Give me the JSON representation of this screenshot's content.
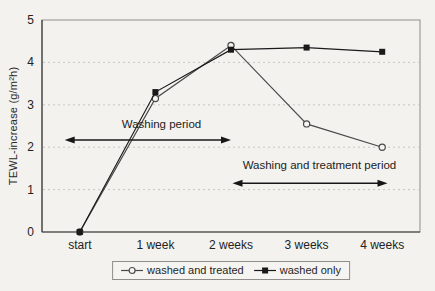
{
  "figure": {
    "background": "#f3f2ef",
    "ink_color": "#1a1a1a",
    "grid_color": "#c9c6c0"
  },
  "chart_data": {
    "type": "line",
    "title": "",
    "xlabel": "",
    "ylabel": "TEWL-increase (g/m²h)",
    "ylim": [
      0,
      5
    ],
    "yticks": [
      0,
      1,
      2,
      3,
      4,
      5
    ],
    "grid": "horizontal dotted lines at 1,2,3,4",
    "legend_position": "bottom-center",
    "categories": [
      "start",
      "1 week",
      "2 weeks",
      "3 weeks",
      "4 weeks"
    ],
    "series": [
      {
        "name": "washed and treated",
        "marker": "circle",
        "color": "#4a4a4a",
        "values": [
          0,
          3.15,
          4.4,
          2.55,
          2.0
        ]
      },
      {
        "name": "washed only",
        "marker": "square",
        "color": "#1a1a1a",
        "values": [
          0,
          3.3,
          4.3,
          4.35,
          4.25
        ]
      }
    ],
    "annotations": [
      {
        "text": "Washing period",
        "x_from": -0.2,
        "x_to": 2.0,
        "arrow_y": 2.17,
        "text_x": 1.08,
        "text_y": 2.45
      },
      {
        "text": "Washing and treatment period",
        "x_from": 2.02,
        "x_to": 4.07,
        "arrow_y": 1.15,
        "text_x": 3.17,
        "text_y": 1.48
      }
    ]
  }
}
